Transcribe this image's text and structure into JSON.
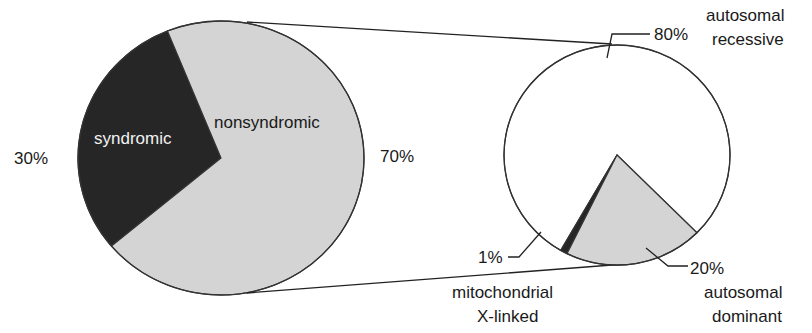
{
  "chart_data": [
    {
      "type": "pie",
      "title": "",
      "slices": [
        {
          "label": "syndromic",
          "value": 30,
          "value_label": "30%",
          "color": "#262626"
        },
        {
          "label": "nonsyndromic",
          "value": 70,
          "value_label": "70%",
          "color": "#d4d4d4"
        }
      ],
      "exploded_slice": "nonsyndromic"
    },
    {
      "type": "pie",
      "title": "",
      "parent": "nonsyndromic",
      "slices": [
        {
          "label": "autosomal recessive",
          "label_lines": [
            "autosomal",
            "recessive"
          ],
          "value": 80,
          "value_label": "80%",
          "color": "#ffffff"
        },
        {
          "label": "autosomal dominant",
          "label_lines": [
            "autosomal",
            "dominant"
          ],
          "value": 20,
          "value_label": "20%",
          "color": "#d4d4d4"
        },
        {
          "label": "mitochondrial / X-linked",
          "label_lines": [
            "mitochondrial",
            "X-linked"
          ],
          "value": 1,
          "value_label": "1%",
          "color": "#262626"
        }
      ]
    }
  ]
}
